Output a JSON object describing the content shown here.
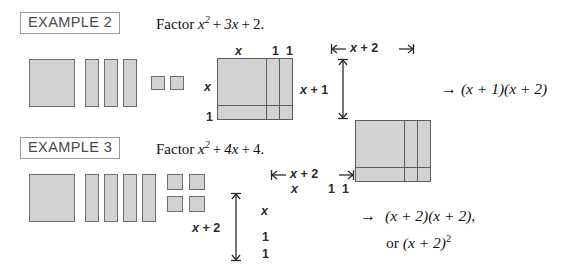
{
  "page": {
    "background": "#ffffff",
    "tile_fill": "#d2d2d2",
    "tile_border": "#6f6f6f",
    "model_border": "#5d5d5d",
    "text_color": "#111111"
  },
  "examples": [
    {
      "id": "example-2",
      "badge": "EXAMPLE 2",
      "problem": {
        "lead": "Factor",
        "term1_base": "x",
        "term1_exp": "2",
        "plus1": "+",
        "term2": "3x",
        "plus2": "+",
        "term3": "2",
        "period": ".",
        "full_text": "Factor x² + 3x + 2."
      },
      "tiles": {
        "big_squares": 1,
        "rectangles": 3,
        "small_squares": 2,
        "small_square_rows": 1,
        "legend": "1 x-squared tile, 3 x tiles, 2 unit tiles"
      },
      "model_a": {
        "caption": "area model with tile subdivisions",
        "top_labels": [
          "x",
          "1",
          "1"
        ],
        "left_labels": [
          "x",
          "1"
        ]
      },
      "model_b": {
        "caption": "area model with overall dimensions",
        "top_dimension": "x + 2",
        "left_dimension": "x + 1"
      },
      "result": {
        "arrow": "→",
        "factors": "(x + 1)(x + 2)",
        "lines": [
          "(x + 1)(x + 2)"
        ]
      }
    },
    {
      "id": "example-3",
      "badge": "EXAMPLE 3",
      "problem": {
        "lead": "Factor",
        "term1_base": "x",
        "term1_exp": "2",
        "plus1": "+",
        "term2": "4x",
        "plus2": "+",
        "term3": "4",
        "period": ".",
        "full_text": "Factor x² + 4x + 4."
      },
      "tiles": {
        "big_squares": 1,
        "rectangles": 4,
        "small_squares": 4,
        "small_square_rows": 2,
        "legend": "1 x-squared tile, 4 x tiles, 4 unit tiles"
      },
      "model_a": {
        "caption": "area model with tile subdivisions and dimensions",
        "top_labels": [
          "x",
          "1",
          "1"
        ],
        "left_labels": [
          "x",
          "1",
          "1"
        ],
        "top_dimension": "x + 2",
        "left_dimension": "x + 2"
      },
      "result": {
        "arrow": "→",
        "factors": "(x + 2)(x + 2),",
        "second_line_prefix": "or",
        "second_line_base": "(x + 2)",
        "second_line_exp": "2",
        "lines": [
          "(x + 2)(x + 2),",
          "or (x + 2)²"
        ]
      }
    }
  ]
}
